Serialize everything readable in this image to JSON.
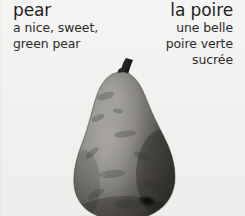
{
  "card": {
    "background_color": "#f2f2f1",
    "type": "bilingual-vocabulary-flashcard"
  },
  "english": {
    "headword": "pear",
    "phrase_line_1": "a nice, sweet,",
    "phrase_line_2": "green pear",
    "text_color": "#1d1d1d",
    "alignment": "left"
  },
  "french": {
    "headword": "la poire",
    "phrase_line_1": "une belle",
    "phrase_line_2": "poire verte",
    "phrase_line_3": "sucrée",
    "text_color": "#1d1d1d",
    "alignment": "right"
  },
  "illustration": {
    "name": "pear-photo",
    "subject": "pear",
    "rendering": "grayscale photograph",
    "body_color": "#6f6d68",
    "shadow_color": "#3d3b38",
    "highlight_color": "#a8a6a0",
    "stem_color": "#2b2a27",
    "blossom_end_color": "#24231f",
    "cropped_edge": "bottom"
  }
}
